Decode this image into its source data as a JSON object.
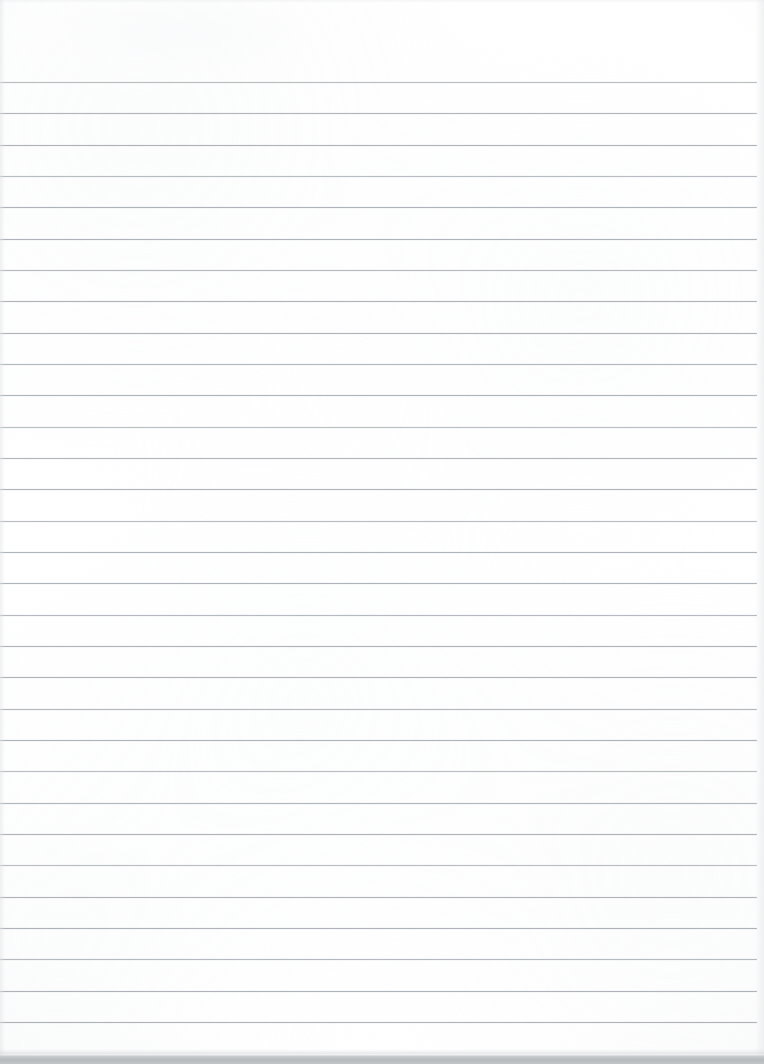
{
  "document": {
    "kind": "scanned-image",
    "subject": "blank ruled notepad page",
    "page_label": "",
    "written_content": "",
    "is_blank": true,
    "width_px": 764,
    "height_px": 1064
  },
  "paper": {
    "background_color": "#ffffff",
    "tone_color": "#f4f5f6",
    "top_margin_px": 82,
    "has_vertical_margin_rule": false,
    "has_header_text": false,
    "has_holes": false
  },
  "ruling": {
    "style": "wide-ruled horizontal lines",
    "line_color": "#9ea4a9",
    "line_thickness_px": 1,
    "line_opacity": 0.82,
    "first_line_y": 82,
    "spacing_px": 31.3,
    "line_count": 31,
    "line_left_x": 0,
    "line_right_x": 757,
    "line_y_positions": [
      82,
      113,
      145,
      176,
      207,
      239,
      270,
      301,
      333,
      364,
      395,
      427,
      458,
      489,
      521,
      552,
      583,
      615,
      646,
      677,
      709,
      740,
      771,
      803,
      834,
      865,
      897,
      928,
      959,
      991,
      1022
    ]
  },
  "edges": {
    "bottom_band_color": "#b7babd",
    "bottom_band_top_y": 1054,
    "bottom_band_height_px": 10,
    "left_shade_color": "#e2e4e6",
    "right_shade_color": "#e6e8e9",
    "top_shade_color": "#e9ebec"
  },
  "annotations": {
    "text_items": [],
    "marks": []
  }
}
